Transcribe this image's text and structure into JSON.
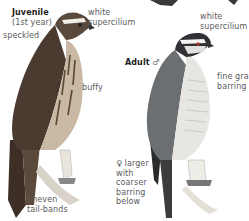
{
  "juvenile": {
    "title": "Juvenile",
    "subtitle": "(1st year)",
    "labels": {
      "supercilium": "white\nsupercilium",
      "speckled": "speckled",
      "buffy": "buffy",
      "tail": "uneven\ntail-bands"
    }
  },
  "adult": {
    "title": "Adult",
    "sex_symbol": "♂",
    "labels": {
      "supercilium": "white\nsupercilium",
      "barring": "fine gray\nbarring",
      "female_note": "♀ larger\nwith\ncoarser\nbarring\nbelow"
    }
  },
  "colors": {
    "ink_dark": "#2a2a2a",
    "juvenile_brown": "#4a3a30",
    "adult_gray": "#6b6f72",
    "breast_light": "#e8e6e2"
  }
}
